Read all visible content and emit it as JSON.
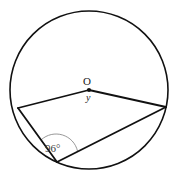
{
  "figure": {
    "background_color": "#ffffff",
    "stroke_color": "#111111",
    "arc_mark_color": "#8c8c8c",
    "labels": {
      "center_point": "O",
      "central_angle": "y",
      "inscribed_angle": "96°"
    },
    "geometry": {
      "circle": {
        "center_x": 89,
        "center_y": 90,
        "radius": 79,
        "stroke_width": 1.6
      },
      "center_dot": {
        "cx": 89,
        "cy": 90,
        "r": 2.1
      },
      "points": {
        "O": {
          "x": 89,
          "y": 90,
          "name": "center"
        },
        "A": {
          "x": 18,
          "y": 108,
          "name": "left-vertex"
        },
        "B": {
          "x": 57,
          "y": 162,
          "name": "bottom-vertex"
        },
        "C": {
          "x": 166,
          "y": 107,
          "name": "right-vertex"
        }
      },
      "segments": [
        {
          "name": "radius-O-A",
          "x1": 89,
          "y1": 90,
          "x2": 18,
          "y2": 108
        },
        {
          "name": "radius-O-C",
          "x1": 89,
          "y1": 90,
          "x2": 166,
          "y2": 107
        },
        {
          "name": "chord-A-B",
          "x1": 18,
          "y1": 108,
          "x2": 57,
          "y2": 162
        },
        {
          "name": "chord-B-C",
          "x1": 57,
          "y1": 162,
          "x2": 166,
          "y2": 107
        }
      ],
      "angle_arc": {
        "name": "angle-arc-at-B",
        "path": "M 41.2 139.8 A 22 22 0 0 1 77.5 151.0",
        "stroke_width": 0.9
      }
    },
    "label_positions": {
      "center_point": {
        "left": 83,
        "top": 76
      },
      "central_angle": {
        "left": 86,
        "top": 93
      },
      "inscribed_angle": {
        "left": 45,
        "top": 143
      }
    }
  }
}
